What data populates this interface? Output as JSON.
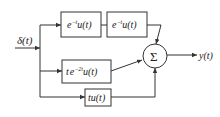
{
  "diagram": {
    "input": {
      "label": "δ(t)"
    },
    "blocks": [
      {
        "id": "block-1",
        "base": "e",
        "sup": "−t",
        "tail": "u(t)"
      },
      {
        "id": "block-2",
        "base": "e",
        "sup": "−t",
        "tail": "u(t)"
      },
      {
        "id": "block-3",
        "pre": "t",
        "base": "e",
        "sup": "−2t",
        "tail": "u(t)"
      },
      {
        "id": "block-4",
        "tail": "tu(t)"
      }
    ],
    "summer": {
      "symbol": "Σ"
    },
    "output": {
      "label": "y(t)"
    },
    "colors": {
      "line": "#333333",
      "background": "#ffffff"
    }
  }
}
